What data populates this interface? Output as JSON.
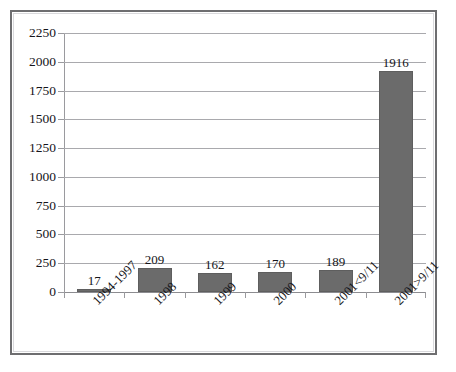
{
  "chart_data": {
    "type": "bar",
    "title": "",
    "subtitle": "",
    "xlabel": "",
    "ylabel": "",
    "categories": [
      "1994-1997",
      "1998",
      "1999",
      "2000",
      "2001<9/11",
      "2001>9/11"
    ],
    "values": [
      17,
      209,
      162,
      170,
      189,
      1916
    ],
    "series": [
      {
        "name": "",
        "values": [
          17,
          209,
          162,
          170,
          189,
          1916
        ]
      }
    ],
    "data_labels": [
      "17",
      "209",
      "162",
      "170",
      "189",
      "1916"
    ],
    "ylim": [
      0,
      2250
    ],
    "ytick_step": 250,
    "ytick_labels": [
      "0",
      "250",
      "500",
      "750",
      "1000",
      "1250",
      "1500",
      "1750",
      "2000",
      "2250"
    ],
    "ytick_values": [
      0,
      250,
      500,
      750,
      1000,
      1250,
      1500,
      1750,
      2000,
      2250
    ],
    "grid": true,
    "grid_axis": "y",
    "legend": false,
    "legend_position": "none",
    "xtick_label_rotation": -45,
    "colors": {
      "bar_fill": "#6b6b6b",
      "bar_stroke": "#5e5e5e",
      "gridline": "#a9a9ad",
      "axis_line": "#9a9a9e",
      "frame_border": "#6e6e70",
      "inner_border": "#d9d9dc",
      "plot_background": "#ffffff",
      "text": "#15151a"
    }
  }
}
